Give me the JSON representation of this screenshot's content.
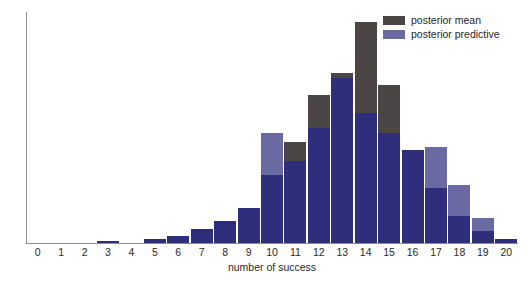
{
  "chart_data": {
    "type": "bar",
    "subtype": "stacked-overlay-histogram",
    "title": "",
    "xlabel": "number of success",
    "ylabel": "",
    "grid": false,
    "legend_position": "top-right",
    "categories": [
      "0",
      "1",
      "2",
      "3",
      "4",
      "5",
      "6",
      "7",
      "8",
      "9",
      "10",
      "11",
      "12",
      "13",
      "14",
      "15",
      "16",
      "17",
      "18",
      "19",
      "20"
    ],
    "ylim": [
      0,
      231
    ],
    "series": [
      {
        "name": "posterior mean",
        "color": "#4b4645",
        "values": [
          0,
          0,
          0,
          2,
          0,
          4,
          7,
          14,
          22,
          35,
          68,
          101,
          148,
          170,
          221,
          158,
          93,
          55,
          27,
          12,
          4
        ]
      },
      {
        "name": "posterior predictive",
        "color": "#6a69a1",
        "values": [
          0,
          0,
          0,
          2,
          0,
          4,
          7,
          14,
          22,
          35,
          110,
          82,
          115,
          165,
          130,
          110,
          93,
          96,
          58,
          25,
          4
        ]
      }
    ],
    "overlap_color": "#2f2e7c"
  },
  "legend": {
    "items": [
      {
        "label": "posterior mean",
        "color": "#4b4645"
      },
      {
        "label": "posterior predictive",
        "color": "#6a69a1"
      }
    ]
  },
  "axes": {
    "x_tick_labels": [
      "0",
      "1",
      "2",
      "3",
      "4",
      "5",
      "6",
      "7",
      "8",
      "9",
      "10",
      "11",
      "12",
      "13",
      "14",
      "15",
      "16",
      "17",
      "18",
      "19",
      "20"
    ],
    "x_axis_title": "number of success"
  },
  "colors": {
    "mean": "#4b4645",
    "predictive": "#6a69a1",
    "overlap": "#2f2e7c",
    "axis": "#8d8d94",
    "text": "#2a2a2a",
    "background": "#ffffff"
  }
}
